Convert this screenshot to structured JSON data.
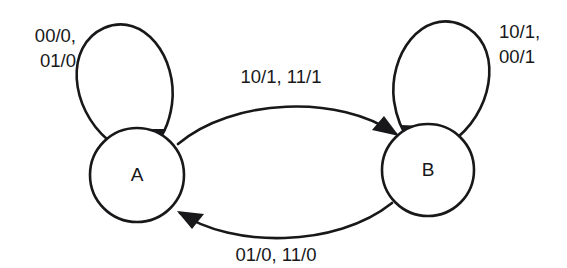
{
  "diagram": {
    "type": "finite-state-machine",
    "background_color": "#ffffff",
    "stroke_color": "#18181a",
    "states": [
      {
        "id": "A",
        "label": "A",
        "cx": 137,
        "cy": 175,
        "r": 47
      },
      {
        "id": "B",
        "label": "B",
        "cx": 428,
        "cy": 170,
        "r": 46
      }
    ],
    "transitions": [
      {
        "id": "a-self",
        "from": "A",
        "to": "A",
        "kind": "self-loop",
        "label_line1": "00/0,",
        "label_line2": "01/0",
        "label_x": 76,
        "label_y1": 42,
        "label_y2": 67,
        "inputs_outputs": [
          "00/0",
          "01/0"
        ]
      },
      {
        "id": "a-to-b",
        "from": "A",
        "to": "B",
        "kind": "arc-top",
        "label": "10/1, 11/1",
        "label_x": 281,
        "label_y": 83,
        "inputs_outputs": [
          "10/1",
          "11/1"
        ]
      },
      {
        "id": "b-self",
        "from": "B",
        "to": "B",
        "kind": "self-loop",
        "label_line1": "10/1,",
        "label_line2": "00/1",
        "label_x": 499,
        "label_y1": 38,
        "label_y2": 63,
        "inputs_outputs": [
          "10/1",
          "00/1"
        ]
      },
      {
        "id": "b-to-a",
        "from": "B",
        "to": "A",
        "kind": "arc-bottom",
        "label": "01/0, 11/0",
        "label_x": 276,
        "label_y": 261,
        "inputs_outputs": [
          "01/0",
          "11/0"
        ]
      }
    ]
  }
}
